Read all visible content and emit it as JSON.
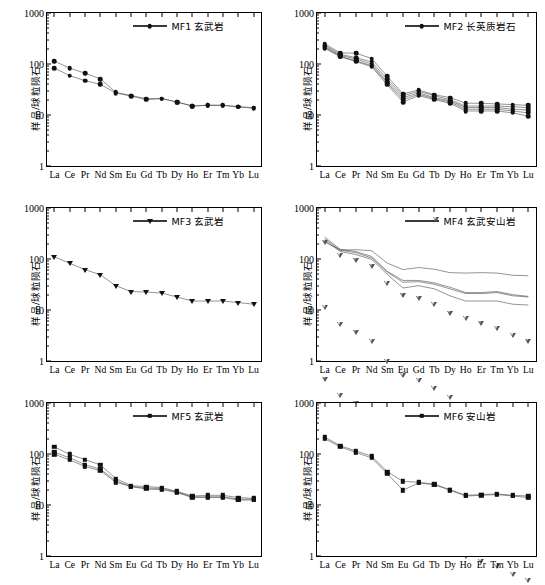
{
  "axis": {
    "y_label": "样品/球粒陨石",
    "y_ticks": [
      "1000",
      "100",
      "10",
      "1"
    ],
    "y_min": 1,
    "y_max": 1000,
    "x_ticks": [
      "La",
      "Ce",
      "Pr",
      "Nd",
      "Sm",
      "Eu",
      "Gd",
      "Tb",
      "Dy",
      "Ho",
      "Er",
      "Tm",
      "Yb",
      "Lu"
    ]
  },
  "chart_data": [
    {
      "type": "line",
      "panel": "MF1",
      "legend": "MF1 玄武岩",
      "marker": "circle-filled",
      "title": "",
      "xlabel": "",
      "ylabel": "样品/球粒陨石",
      "ylim": [
        1,
        1000
      ],
      "log_y": true,
      "grid": false,
      "legend_position": "top-center",
      "categories": [
        "La",
        "Ce",
        "Pr",
        "Nd",
        "Sm",
        "Eu",
        "Gd",
        "Tb",
        "Dy",
        "Ho",
        "Er",
        "Tm",
        "Yb",
        "Lu"
      ],
      "series": [
        {
          "name": "MF1-a",
          "values": [
            113,
            83,
            66,
            51,
            28,
            24,
            21,
            21,
            18,
            15,
            15.5,
            15.5,
            14.5,
            14
          ]
        },
        {
          "name": "MF1-b",
          "values": [
            83,
            59,
            47,
            40,
            27,
            23.5,
            20,
            21,
            18,
            15,
            15.5,
            15.5,
            14.5,
            13.5
          ]
        }
      ]
    },
    {
      "type": "line",
      "panel": "MF2",
      "legend": "MF2 长英质岩石",
      "marker": "circle-filled",
      "title": "",
      "xlabel": "",
      "ylabel": "样品/球粒陨石",
      "ylim": [
        1,
        1000
      ],
      "log_y": true,
      "grid": false,
      "legend_position": "top-center",
      "categories": [
        "La",
        "Ce",
        "Pr",
        "Nd",
        "Sm",
        "Eu",
        "Gd",
        "Tb",
        "Dy",
        "Ho",
        "Er",
        "Tm",
        "Yb",
        "Lu"
      ],
      "series": [
        {
          "name": "MF2-a",
          "values": [
            250,
            165,
            163,
            128,
            57,
            26,
            31,
            25,
            22,
            17,
            17,
            16.5,
            16,
            15.5
          ]
        },
        {
          "name": "MF2-b",
          "values": [
            235,
            155,
            133,
            110,
            50,
            24,
            29,
            24,
            20,
            15,
            15,
            15,
            14.5,
            14
          ]
        },
        {
          "name": "MF2-c",
          "values": [
            222,
            148,
            125,
            100,
            45,
            22,
            27,
            22,
            19,
            14,
            14,
            14,
            13,
            12.5
          ]
        },
        {
          "name": "MF2-d",
          "values": [
            212,
            142,
            115,
            93,
            42,
            20,
            25.5,
            21,
            18,
            13,
            13,
            13,
            12,
            11
          ]
        },
        {
          "name": "MF2-e",
          "values": [
            205,
            138,
            112,
            88,
            39,
            18,
            24,
            20,
            17,
            12,
            12,
            12,
            11,
            9.5
          ]
        }
      ]
    },
    {
      "type": "line",
      "panel": "MF3",
      "legend": "MF3 玄武岩",
      "marker": "triangle-down-filled",
      "title": "",
      "xlabel": "",
      "ylabel": "样品/球粒陨石",
      "ylim": [
        1,
        1000
      ],
      "log_y": true,
      "grid": false,
      "legend_position": "top-center",
      "categories": [
        "La",
        "Ce",
        "Pr",
        "Nd",
        "Sm",
        "Eu",
        "Gd",
        "Tb",
        "Dy",
        "Ho",
        "Er",
        "Tm",
        "Yb",
        "Lu"
      ],
      "series": [
        {
          "name": "MF3-a",
          "values": [
            110,
            82,
            62,
            49,
            30,
            23,
            22.5,
            21.5,
            18,
            15,
            15,
            15,
            14,
            13
          ]
        }
      ]
    },
    {
      "type": "line",
      "panel": "MF4",
      "legend": "MF4 玄武安山岩",
      "marker": "triangle-down-open",
      "title": "",
      "xlabel": "",
      "ylabel": "样品/球粒陨石",
      "ylim": [
        1,
        1000
      ],
      "log_y": true,
      "grid": false,
      "legend_position": "top-center",
      "categories": [
        "La",
        "Ce",
        "Pr",
        "Nd",
        "Sm",
        "Eu",
        "Gd",
        "Tb",
        "Dy",
        "Ho",
        "Er",
        "Tm",
        "Yb",
        "Lu"
      ],
      "series": [
        {
          "name": "MF4-a",
          "values": [
            218,
            150,
            152,
            145,
            83,
            62,
            68,
            63,
            54,
            53,
            54,
            53,
            48,
            47
          ]
        },
        {
          "name": "MF4-b",
          "values": [
            268,
            155,
            140,
            112,
            57,
            38,
            38,
            34,
            28,
            22,
            22,
            23,
            20,
            18.5
          ]
        },
        {
          "name": "MF4-c",
          "values": [
            248,
            148,
            133,
            105,
            55,
            35,
            36,
            32,
            26,
            21,
            21,
            22,
            19,
            18
          ]
        },
        {
          "name": "MF4-d",
          "values": [
            230,
            140,
            122,
            98,
            50,
            27,
            30,
            26,
            19,
            15,
            15,
            15,
            13,
            12.5
          ]
        }
      ]
    },
    {
      "type": "line",
      "panel": "MF5",
      "legend": "MF5 玄武岩",
      "marker": "square-filled",
      "title": "",
      "xlabel": "",
      "ylabel": "样品/球粒陨石",
      "ylim": [
        1,
        1000
      ],
      "log_y": true,
      "grid": false,
      "legend_position": "top-center",
      "categories": [
        "La",
        "Ce",
        "Pr",
        "Nd",
        "Sm",
        "Eu",
        "Gd",
        "Tb",
        "Dy",
        "Ho",
        "Er",
        "Tm",
        "Yb",
        "Lu"
      ],
      "series": [
        {
          "name": "MF5-a",
          "values": [
            137,
            98,
            78,
            61,
            33,
            24,
            23,
            22,
            18.5,
            15,
            15.5,
            15.5,
            14,
            13.5
          ]
        },
        {
          "name": "MF5-b",
          "values": [
            108,
            84,
            62,
            50,
            30,
            23,
            21.5,
            21,
            18,
            14.5,
            14.5,
            14.5,
            13,
            13
          ]
        },
        {
          "name": "MF5-c",
          "values": [
            99,
            76,
            57,
            47,
            28,
            23,
            20.5,
            20,
            17.5,
            14,
            14,
            14,
            12.5,
            12.5
          ]
        }
      ]
    },
    {
      "type": "line",
      "panel": "MF6",
      "legend": "MF6 安山岩",
      "marker": "square-filled",
      "title": "",
      "xlabel": "",
      "ylabel": "样品/球粒陨石",
      "ylim": [
        1,
        1000
      ],
      "log_y": true,
      "grid": false,
      "legend_position": "top-center",
      "categories": [
        "La",
        "Ce",
        "Pr",
        "Nd",
        "Sm",
        "Eu",
        "Gd",
        "Tb",
        "Dy",
        "Ho",
        "Er",
        "Tm",
        "Yb",
        "Lu"
      ],
      "series": [
        {
          "name": "MF6-a",
          "values": [
            215,
            145,
            115,
            91,
            45,
            29,
            28,
            25.5,
            20,
            15.5,
            16,
            16.5,
            15.5,
            15
          ]
        },
        {
          "name": "MF6-b",
          "values": [
            200,
            138,
            107,
            84,
            41,
            19.5,
            27,
            25,
            19.5,
            15,
            15.5,
            16,
            15,
            14
          ]
        }
      ]
    }
  ],
  "colors": {
    "line": "#3a3a3a",
    "marker": "#111111",
    "axis": "#000000"
  }
}
